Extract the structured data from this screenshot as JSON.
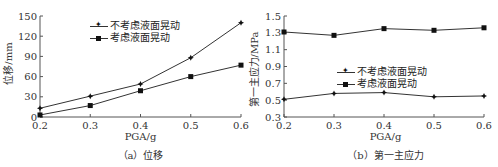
{
  "chart_data": [
    {
      "type": "line",
      "title": "",
      "caption": "（a）位移",
      "xlabel": "PGA/g",
      "ylabel": "位移/mm",
      "x": [
        0.2,
        0.3,
        0.4,
        0.5,
        0.6
      ],
      "x_ticks": [
        "0.2",
        "0.3",
        "0.4",
        "0.5",
        "0.6"
      ],
      "y_ticks": [
        "0",
        "30",
        "60",
        "90",
        "120",
        "150"
      ],
      "ylim": [
        0,
        150
      ],
      "xlim": [
        0.2,
        0.6
      ],
      "grid": false,
      "legend_position": "upper-left-inside",
      "series": [
        {
          "name": "不考虑液面晃动",
          "marker": "star",
          "values": [
            13,
            31,
            49,
            88,
            140
          ]
        },
        {
          "name": "考虑液面晃动",
          "marker": "square",
          "values": [
            3,
            17,
            39,
            60,
            77
          ]
        }
      ]
    },
    {
      "type": "line",
      "title": "",
      "caption": "（b）第一主应力",
      "xlabel": "PGA/g",
      "ylabel": "第一主应力/MPa",
      "x": [
        0.2,
        0.3,
        0.4,
        0.5,
        0.6
      ],
      "x_ticks": [
        "0.2",
        "0.3",
        "0.4",
        "0.5",
        "0.6"
      ],
      "y_ticks": [
        "0.3",
        "0.5",
        "0.7",
        "0.9",
        "1.1",
        "1.3",
        "1.5"
      ],
      "ylim": [
        0.3,
        1.5
      ],
      "xlim": [
        0.2,
        0.6
      ],
      "grid": false,
      "legend_position": "center-left-inside",
      "series": [
        {
          "name": "不考虑液面晃动",
          "marker": "star",
          "values": [
            0.51,
            0.58,
            0.59,
            0.54,
            0.55
          ]
        },
        {
          "name": "考虑液面晃动",
          "marker": "square",
          "values": [
            1.31,
            1.27,
            1.35,
            1.33,
            1.36
          ]
        }
      ]
    }
  ],
  "colors": {
    "line": "#333333",
    "marker": "#111111",
    "axis": "#555555",
    "text": "#333333"
  }
}
